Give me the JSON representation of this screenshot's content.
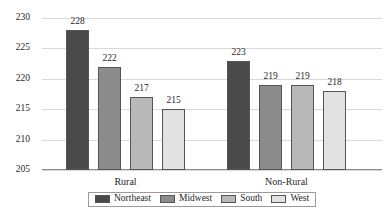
{
  "chart_data": {
    "type": "bar",
    "title": "",
    "subtitle": "",
    "xlabel": "",
    "ylabel": "",
    "categories": [
      "Rural",
      "Non-Rural"
    ],
    "ylim": [
      205,
      230
    ],
    "yticks": [
      205,
      210,
      215,
      220,
      225,
      230
    ],
    "ytick_labels": [
      "205",
      "210",
      "215",
      "220",
      "225",
      "230"
    ],
    "grid": true,
    "legend_position": "bottom-center",
    "data_labels": true,
    "series": [
      {
        "name": "Northeast",
        "color": "#4a4a4a",
        "values": [
          228,
          223
        ],
        "labels": [
          "228",
          "223"
        ]
      },
      {
        "name": "Midwest",
        "color": "#8c8c8c",
        "values": [
          222,
          219
        ],
        "labels": [
          "222",
          "219"
        ]
      },
      {
        "name": "South",
        "color": "#b9b9b9",
        "values": [
          217,
          219
        ],
        "labels": [
          "217",
          "219"
        ]
      },
      {
        "name": "West",
        "color": "#e2e2e2",
        "values": [
          215,
          218
        ],
        "labels": [
          "215",
          "218"
        ]
      }
    ]
  },
  "legend": {
    "items": [
      {
        "label": "Northeast",
        "color": "#4a4a4a"
      },
      {
        "label": "Midwest",
        "color": "#8c8c8c"
      },
      {
        "label": "South",
        "color": "#b9b9b9"
      },
      {
        "label": "West",
        "color": "#e2e2e2"
      }
    ]
  }
}
